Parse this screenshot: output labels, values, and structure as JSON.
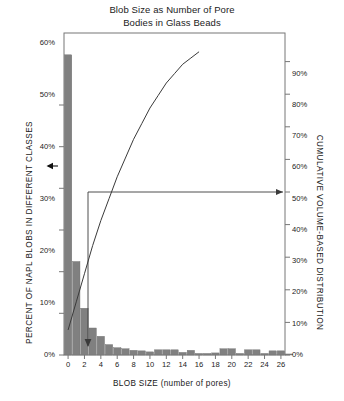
{
  "chart_data": {
    "type": "bar",
    "title": "Blob Size as Number of Pore Bodies in Glass Beads",
    "title_lines": [
      "Blob Size as Number of Pore",
      "Bodies in Glass Beads"
    ],
    "xlabel": "BLOB SIZE (number of pores)",
    "ylabel": "PERCENT OF NAPL BLOBS IN DIFFERENT CLASSES",
    "ylabel_right": "CUMULATIVE VOLUME-BASED DISTRIBUTION",
    "grid": false,
    "legend": "none",
    "xlim": [
      0,
      27
    ],
    "ylim": [
      0,
      62
    ],
    "ylim_right": [
      0,
      103
    ],
    "x_ticks": [
      0,
      2,
      4,
      6,
      8,
      10,
      12,
      14,
      16,
      18,
      20,
      22,
      24,
      26
    ],
    "x_tick_labels": [
      "0",
      "2",
      "4",
      "6",
      "8",
      "10",
      "12",
      "14",
      "16",
      "18",
      "20",
      "22",
      "24",
      "26"
    ],
    "y_ticks_left": [
      0,
      10,
      20,
      30,
      40,
      50,
      60
    ],
    "y_tick_labels_left": [
      "0%",
      "10%",
      "20%",
      "30%",
      "40%",
      "50%",
      "60%"
    ],
    "y_ticks_right": [
      0,
      10,
      20,
      30,
      40,
      50,
      60,
      70,
      80,
      90
    ],
    "y_tick_labels_right": [
      "0%",
      "10%",
      "20%",
      "30%",
      "40%",
      "50%",
      "60%",
      "70%",
      "80%",
      "90%"
    ],
    "bar_color": "#808080",
    "line_color": "#3a3a3a",
    "categories": [
      0,
      1,
      2,
      3,
      4,
      5,
      6,
      7,
      8,
      9,
      10,
      11,
      12,
      13,
      14,
      15,
      16,
      17,
      18,
      19,
      20,
      21,
      22,
      23,
      24,
      25,
      26,
      27
    ],
    "series": [
      {
        "name": "Percent of NAPL blobs in different classes",
        "axis": "left",
        "values": [
          57.8,
          18.0,
          9.0,
          5.2,
          3.6,
          2.0,
          1.4,
          1.2,
          0.9,
          0.8,
          0.6,
          1.0,
          1.0,
          1.0,
          0.5,
          0.9,
          0.3,
          0.3,
          0.4,
          1.2,
          1.2,
          0.3,
          1.0,
          1.0,
          0.3,
          0.8,
          0.8,
          0.2
        ]
      },
      {
        "name": "Cumulative volume-based distribution",
        "axis": "right",
        "type": "line",
        "x": [
          0,
          1,
          2,
          3,
          4,
          5,
          6,
          7,
          8,
          9,
          10,
          11,
          12,
          13,
          14,
          15,
          16
        ],
        "values": [
          8,
          17,
          26,
          35,
          43,
          50,
          57,
          63,
          69,
          74,
          79,
          83,
          87,
          90,
          93,
          95,
          97
        ]
      }
    ],
    "annotations": [
      {
        "name": "left-arrow-to-bars",
        "label": "",
        "type": "arrow",
        "direction": "left",
        "at_y_percent_left": 45.0
      },
      {
        "name": "cumulative-50-percent-arrow",
        "label": "",
        "type": "arrow",
        "direction": "right",
        "at_y_percent_right": 50.0
      },
      {
        "name": "median-blob-size-arrow",
        "label": "",
        "type": "arrow",
        "direction": "down",
        "at_x_blob_size": 5.0
      }
    ]
  }
}
